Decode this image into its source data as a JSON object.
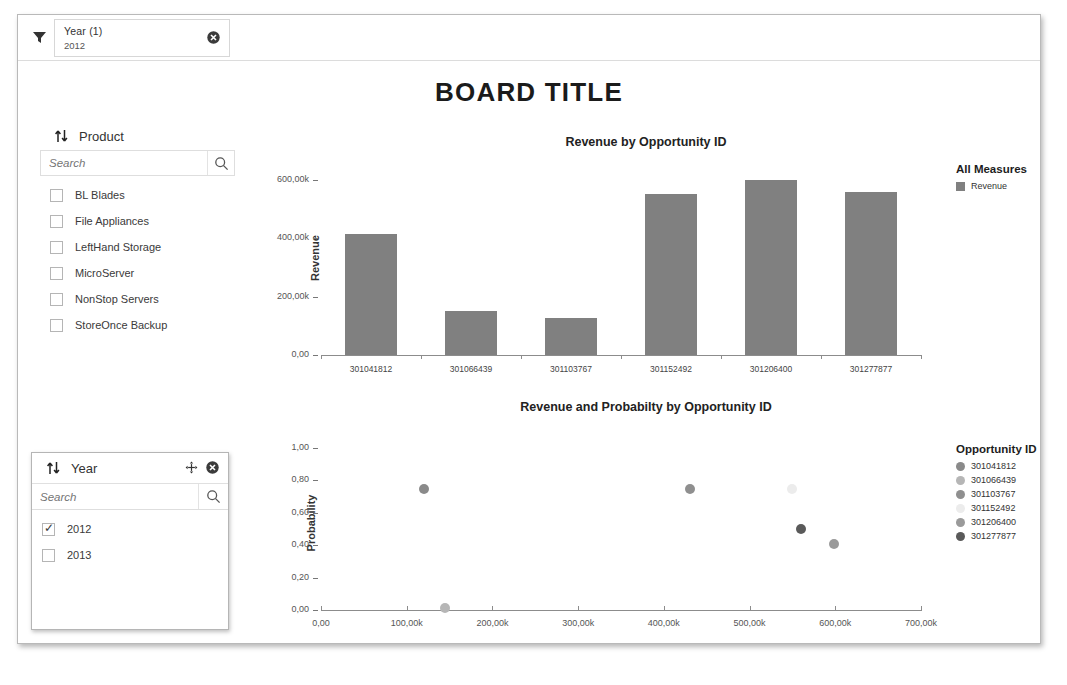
{
  "filter_bar": {
    "funnel_icon": "funnel-icon",
    "chip": {
      "title": "Year (1)",
      "value": "2012",
      "close_icon": "close-icon"
    }
  },
  "board": {
    "title": "BOARD TITLE"
  },
  "panels": [
    {
      "id": "product",
      "name": "Product",
      "sort_icon": "sort-updown-icon",
      "search_placeholder": "Search",
      "search_value": "",
      "search_icon": "magnifier-icon",
      "options": [
        {
          "label": "BL Blades",
          "checked": false
        },
        {
          "label": "File Appliances",
          "checked": false
        },
        {
          "label": "LeftHand Storage",
          "checked": false
        },
        {
          "label": "MicroServer",
          "checked": false
        },
        {
          "label": "NonStop Servers",
          "checked": false
        },
        {
          "label": "StoreOnce Backup",
          "checked": false
        }
      ]
    },
    {
      "id": "year",
      "name": "Year",
      "sort_icon": "sort-updown-icon",
      "move_icon": "move-icon",
      "close_icon": "close-icon",
      "search_placeholder": "Search",
      "search_value": "",
      "search_icon": "magnifier-icon",
      "options": [
        {
          "label": "2012",
          "checked": true
        },
        {
          "label": "2013",
          "checked": false
        }
      ]
    }
  ],
  "colors": {
    "bar_fill": "#808080",
    "axis": "#8c8c8c",
    "series": [
      "#8a8a8a",
      "#b6b6b6",
      "#8f8f8f",
      "#ececec",
      "#9a9a9a",
      "#5a5a5a"
    ]
  },
  "chart_data": [
    {
      "type": "bar",
      "title": "Revenue by Opportunity ID",
      "xlabel": "",
      "ylabel": "Revenue",
      "categories": [
        "301041812",
        "301066439",
        "301103767",
        "301152492",
        "301206400",
        "301277877"
      ],
      "values": [
        415000,
        150000,
        125000,
        550000,
        598000,
        557000
      ],
      "ylim": [
        0,
        650000
      ],
      "yticks": [
        0,
        200000,
        400000,
        600000
      ],
      "ytick_labels": [
        "0,00",
        "200,00k",
        "400,00k",
        "600,00k"
      ],
      "grid": false,
      "legend": {
        "title": "All Measures",
        "position": "right",
        "entries": [
          {
            "label": "Revenue",
            "color": "#808080"
          }
        ]
      }
    },
    {
      "type": "scatter",
      "title": "Revenue and Probabilty by Opportunity ID",
      "xlabel": "",
      "ylabel": "Probability",
      "xlim": [
        0,
        700000
      ],
      "ylim": [
        0,
        1.05
      ],
      "xticks": [
        0,
        100000,
        200000,
        300000,
        400000,
        500000,
        600000,
        700000
      ],
      "xtick_labels": [
        "0,00",
        "100,00k",
        "200,00k",
        "300,00k",
        "400,00k",
        "500,00k",
        "600,00k",
        "700,00k"
      ],
      "yticks": [
        0,
        0.2,
        0.4,
        0.6,
        0.8,
        1.0
      ],
      "ytick_labels": [
        "0,00",
        "0,20",
        "0,40",
        "0,60",
        "0,80",
        "1,00"
      ],
      "grid": false,
      "points": [
        {
          "name": "301041812",
          "x": 120000,
          "y": 0.75,
          "color": "#8a8a8a"
        },
        {
          "name": "301066439",
          "x": 145000,
          "y": 0.01,
          "color": "#b6b6b6"
        },
        {
          "name": "301103767",
          "x": 430000,
          "y": 0.75,
          "color": "#8f8f8f"
        },
        {
          "name": "301152492",
          "x": 550000,
          "y": 0.75,
          "color": "#ececec"
        },
        {
          "name": "301206400",
          "x": 598000,
          "y": 0.41,
          "color": "#9a9a9a"
        },
        {
          "name": "301277877",
          "x": 560000,
          "y": 0.5,
          "color": "#5a5a5a"
        }
      ],
      "legend": {
        "title": "Opportunity ID",
        "position": "right",
        "entries": [
          {
            "label": "301041812",
            "color": "#8a8a8a"
          },
          {
            "label": "301066439",
            "color": "#b6b6b6"
          },
          {
            "label": "301103767",
            "color": "#8f8f8f"
          },
          {
            "label": "301152492",
            "color": "#ececec"
          },
          {
            "label": "301206400",
            "color": "#9a9a9a"
          },
          {
            "label": "301277877",
            "color": "#5a5a5a"
          }
        ]
      }
    }
  ]
}
